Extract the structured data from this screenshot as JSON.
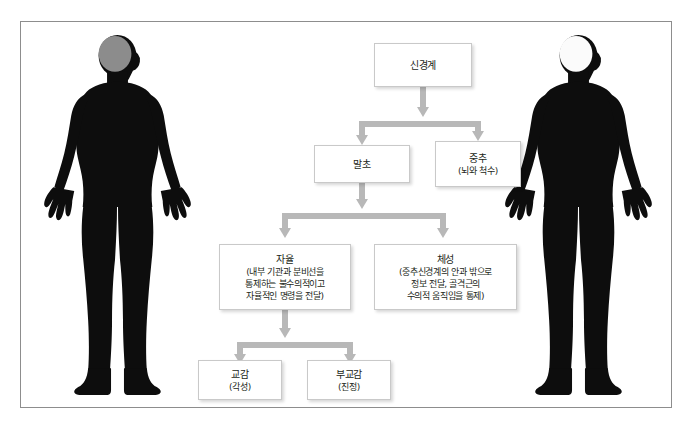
{
  "diagram": {
    "title_text": "신경계 구조도",
    "frame_border_color": "#8d8d8d",
    "connector_color": "#b3b3b3",
    "node_border_color": "#c9c9c9",
    "text_color": "#231f20"
  },
  "figures": {
    "left": {
      "name": "peripheral-nervous-system-figure",
      "body_color": "#0d0d0d",
      "brain_color": "#8c8c8c",
      "nerve_color": "#d8d8d8",
      "emphasis": "peripheral-nerves"
    },
    "right": {
      "name": "central-nervous-system-figure",
      "body_color": "#0d0d0d",
      "brain_color": "#ffffff",
      "spinal_cord_color": "#ffffff",
      "nerve_color": "#232323",
      "emphasis": "brain-and-spinal-cord"
    }
  },
  "nodes": {
    "nervous_system": {
      "title": "신경계",
      "sub": []
    },
    "peripheral": {
      "title": "말초",
      "sub": []
    },
    "central": {
      "title": "중추",
      "sub": [
        "(뇌와 척수)"
      ]
    },
    "autonomic": {
      "title": "자율",
      "sub": [
        "(내부 기관과 분비선을",
        "통제하는 불수의적이고",
        "자율적인 명령을 전달)"
      ]
    },
    "somatic": {
      "title": "체성",
      "sub": [
        "(중추신경계의 안과 밖으로",
        "정보 전달, 골격근의",
        "수의적 움직임을 통제)"
      ]
    },
    "sympathetic": {
      "title": "교감",
      "sub": [
        "(각성)"
      ]
    },
    "parasympathetic": {
      "title": "부교감",
      "sub": [
        "(진정)"
      ]
    }
  }
}
